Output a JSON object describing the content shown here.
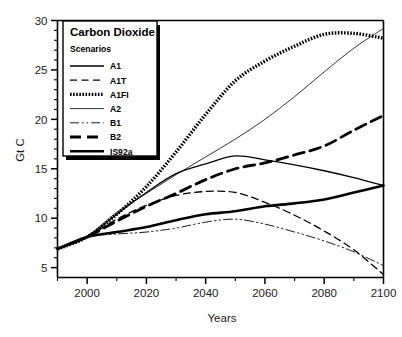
{
  "chart_data": {
    "type": "line",
    "title": "",
    "xlabel": "Years",
    "ylabel": "Gt C",
    "xlim": [
      1990,
      2100
    ],
    "ylim": [
      4,
      30
    ],
    "grid": false,
    "legend_position": "top-left",
    "legend_title": "Carbon Dioxide",
    "legend_subtitle": "Scenarios",
    "x_ticks_major": [
      2000,
      2020,
      2040,
      2060,
      2080,
      2100
    ],
    "x_tick_labels": [
      "2000",
      "2020",
      "2040",
      "2060",
      "2080",
      "2100"
    ],
    "x_ticks_minor": [
      1990,
      2010,
      2030,
      2050,
      2070,
      2090
    ],
    "y_ticks_major": [
      5,
      10,
      15,
      20,
      25,
      30
    ],
    "y_tick_labels": [
      "5",
      "10",
      "15",
      "20",
      "25",
      "30"
    ],
    "y_ticks_minor": [
      6,
      7,
      8,
      9,
      11,
      12,
      13,
      14,
      16,
      17,
      18,
      19,
      21,
      22,
      23,
      24,
      26,
      27,
      28,
      29
    ],
    "x": [
      1990,
      2000,
      2010,
      2020,
      2030,
      2040,
      2050,
      2060,
      2070,
      2080,
      2090,
      2100
    ],
    "series": [
      {
        "name": "A1",
        "style": "solid",
        "width": 1.3,
        "color": "#000000",
        "values": [
          6.9,
          8.1,
          10.4,
          12.6,
          14.5,
          15.5,
          16.3,
          15.9,
          15.4,
          14.8,
          14.1,
          13.3
        ]
      },
      {
        "name": "A1T",
        "style": "dashed",
        "width": 1.3,
        "color": "#000000",
        "values": [
          6.9,
          8.1,
          9.9,
          11.3,
          12.3,
          12.7,
          12.6,
          11.6,
          10.3,
          8.7,
          6.8,
          4.3
        ]
      },
      {
        "name": "A1FI",
        "style": "dotted",
        "width": 3.4,
        "color": "#000000",
        "values": [
          6.9,
          8.1,
          10.4,
          13.2,
          16.7,
          20.5,
          23.9,
          25.9,
          27.4,
          28.6,
          28.7,
          28.2
        ]
      },
      {
        "name": "A2",
        "style": "solid",
        "width": 0.8,
        "color": "#000000",
        "values": [
          6.9,
          8.2,
          10.6,
          12.5,
          14.4,
          16.2,
          18.0,
          20.0,
          22.3,
          24.8,
          27.2,
          29.2
        ]
      },
      {
        "name": "B1",
        "style": "dashdot",
        "width": 0.9,
        "color": "#000000",
        "values": [
          6.9,
          8.1,
          8.4,
          8.6,
          9.0,
          9.6,
          9.9,
          9.4,
          8.6,
          7.7,
          6.6,
          5.2
        ]
      },
      {
        "name": "B2",
        "style": "longdash",
        "width": 2.8,
        "color": "#000000",
        "values": [
          6.9,
          8.1,
          9.7,
          11.2,
          12.5,
          13.9,
          15.0,
          15.6,
          16.4,
          17.3,
          18.9,
          20.4
        ]
      },
      {
        "name": "IS92a",
        "style": "solid",
        "width": 2.6,
        "color": "#000000",
        "values": [
          6.9,
          8.1,
          8.6,
          9.1,
          9.8,
          10.4,
          10.7,
          11.2,
          11.5,
          11.9,
          12.6,
          13.3
        ]
      }
    ]
  },
  "legend": {
    "title": "Carbon Dioxide",
    "subtitle": "Scenarios",
    "entries": [
      {
        "label": "A1"
      },
      {
        "label": "A1T"
      },
      {
        "label": "A1FI"
      },
      {
        "label": "A2"
      },
      {
        "label": "B1"
      },
      {
        "label": "B2"
      },
      {
        "label": "IS92a"
      }
    ]
  },
  "axes": {
    "x_title": "Years",
    "y_title": "Gt C"
  },
  "caption": {
    "text": ""
  }
}
